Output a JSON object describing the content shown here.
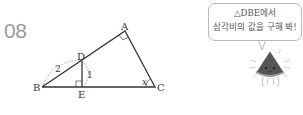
{
  "problem": {
    "number": "08",
    "figure": {
      "points": {
        "A": {
          "label": "A",
          "x": 125,
          "y": 31
        },
        "B": {
          "label": "B",
          "x": 42,
          "y": 87
        },
        "C": {
          "label": "C",
          "x": 155,
          "y": 87
        },
        "D": {
          "label": "D",
          "x": 82,
          "y": 62
        },
        "E": {
          "label": "E",
          "x": 82,
          "y": 87
        }
      },
      "right_angles": [
        "A",
        "E"
      ],
      "angle_label": "x",
      "segment_labels": {
        "BD": "2",
        "DE": "1"
      }
    },
    "hint": {
      "line1": "△DBE에서",
      "line2": "삼각비의 값을 구해 봐!"
    },
    "mascot": "watermelon-mascot"
  }
}
